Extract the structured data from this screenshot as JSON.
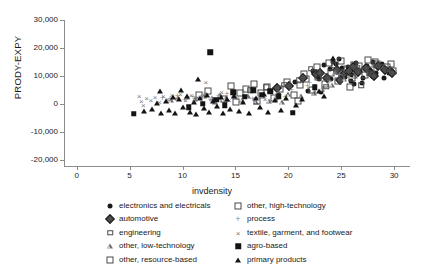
{
  "chart_data": {
    "type": "scatter",
    "title": "",
    "xlabel": "invdensity",
    "ylabel": "PRODY-EXPY",
    "xlim": [
      -1.2,
      31.5
    ],
    "ylim": [
      -22000,
      32000
    ],
    "xticks": [
      0,
      5,
      10,
      15,
      20,
      25,
      30
    ],
    "xticklabels": [
      "0",
      "5",
      "10",
      "15",
      "20",
      "25",
      "30"
    ],
    "yticks": [
      30000,
      20000,
      10000,
      0,
      -10000,
      -20000
    ],
    "yticklabels": [
      "30,000",
      "20,000",
      "10,000",
      "0",
      "-10,000",
      "-20,000"
    ],
    "grid": false,
    "legend_position": "below-axes",
    "series": [
      {
        "name": "electronics and electricals",
        "marker": "filled-circle",
        "color": "#1a1a1a",
        "points": [
          [
            22.3,
            11600
          ],
          [
            22.9,
            8800
          ],
          [
            23.4,
            13900
          ],
          [
            23.9,
            12400
          ],
          [
            24.2,
            15000
          ],
          [
            24.5,
            14100
          ],
          [
            24.8,
            16000
          ],
          [
            25.1,
            12800
          ],
          [
            25.4,
            9600
          ],
          [
            25.6,
            13200
          ],
          [
            26.0,
            10200
          ],
          [
            26.4,
            14500
          ],
          [
            26.8,
            11800
          ],
          [
            27.1,
            9100
          ],
          [
            27.4,
            13400
          ],
          [
            27.7,
            12100
          ],
          [
            28.0,
            14800
          ],
          [
            28.3,
            11200
          ],
          [
            28.6,
            13000
          ],
          [
            28.9,
            14200
          ],
          [
            29.2,
            12600
          ],
          [
            29.5,
            11000
          ],
          [
            21.9,
            4800
          ],
          [
            23.1,
            4200
          ],
          [
            24.0,
            9000
          ],
          [
            25.9,
            8200
          ],
          [
            27.0,
            7400
          ],
          [
            20.6,
            7900
          ],
          [
            26.2,
            7000
          ],
          [
            29.0,
            9400
          ]
        ]
      },
      {
        "name": "automotive",
        "marker": "filled-diamond",
        "color": "#4d4d4d",
        "points": [
          [
            22.6,
            10800
          ],
          [
            23.7,
            9400
          ],
          [
            24.6,
            12200
          ],
          [
            25.2,
            10400
          ],
          [
            26.1,
            13100
          ],
          [
            26.6,
            11400
          ],
          [
            27.3,
            12900
          ],
          [
            27.9,
            10600
          ],
          [
            28.5,
            13600
          ],
          [
            29.1,
            12000
          ],
          [
            29.6,
            11600
          ],
          [
            29.8,
            10900
          ],
          [
            21.4,
            9100
          ],
          [
            23.0,
            11000
          ],
          [
            24.9,
            8600
          ],
          [
            25.7,
            11900
          ],
          [
            28.1,
            9800
          ],
          [
            18.9,
            5600
          ],
          [
            20.1,
            6300
          ]
        ]
      },
      {
        "name": "engineering",
        "marker": "open-square-sm",
        "color": "#4a4a4a",
        "points": [
          [
            22.1,
            12500
          ],
          [
            23.3,
            10000
          ],
          [
            24.3,
            13800
          ],
          [
            25.0,
            11300
          ],
          [
            26.5,
            12700
          ],
          [
            27.6,
            11000
          ],
          [
            28.8,
            13300
          ],
          [
            29.4,
            12200
          ],
          [
            21.0,
            8400
          ],
          [
            19.6,
            6800
          ],
          [
            17.9,
            5900
          ],
          [
            16.4,
            4900
          ],
          [
            23.6,
            6200
          ],
          [
            26.9,
            6600
          ]
        ]
      },
      {
        "name": "other, low-technology",
        "marker": "open-triangle",
        "color": "#6e6e6e",
        "points": [
          [
            9.6,
            2100
          ],
          [
            10.4,
            2600
          ],
          [
            11.2,
            1800
          ],
          [
            12.0,
            2900
          ],
          [
            12.8,
            2300
          ],
          [
            13.5,
            3100
          ],
          [
            14.1,
            2000
          ],
          [
            14.9,
            3400
          ],
          [
            15.6,
            1500
          ],
          [
            16.2,
            2800
          ],
          [
            16.9,
            900
          ],
          [
            17.6,
            3000
          ],
          [
            18.2,
            1200
          ],
          [
            18.8,
            2400
          ],
          [
            19.4,
            600
          ],
          [
            20.0,
            3600
          ],
          [
            21.2,
            2700
          ],
          [
            22.4,
            4100
          ],
          [
            23.2,
            5400
          ],
          [
            24.1,
            6900
          ],
          [
            25.3,
            8800
          ],
          [
            26.3,
            10100
          ],
          [
            8.9,
            1400
          ],
          [
            13.1,
            800
          ],
          [
            19.0,
            4300
          ],
          [
            24.4,
            11400
          ]
        ]
      },
      {
        "name": "other, resource-based",
        "marker": "open-square",
        "color": "#4a4a4a",
        "points": [
          [
            14.6,
            6400
          ],
          [
            15.4,
            3900
          ],
          [
            16.0,
            5200
          ],
          [
            16.8,
            7100
          ],
          [
            17.4,
            4100
          ],
          [
            18.0,
            6000
          ],
          [
            18.6,
            2200
          ],
          [
            19.2,
            5500
          ],
          [
            19.9,
            7800
          ],
          [
            20.5,
            3300
          ],
          [
            21.1,
            6700
          ],
          [
            21.7,
            8900
          ],
          [
            22.2,
            5000
          ],
          [
            22.8,
            9600
          ],
          [
            23.5,
            7300
          ],
          [
            24.0,
            11000
          ],
          [
            24.7,
            8100
          ],
          [
            25.5,
            12300
          ],
          [
            26.0,
            9200
          ],
          [
            26.7,
            13500
          ],
          [
            27.2,
            10300
          ],
          [
            27.8,
            12000
          ],
          [
            28.4,
            14100
          ],
          [
            29.3,
            13000
          ],
          [
            29.9,
            11700
          ],
          [
            13.9,
            1700
          ],
          [
            15.1,
            900
          ],
          [
            17.0,
            1000
          ],
          [
            20.9,
            1100
          ],
          [
            12.4,
            4600
          ],
          [
            11.6,
            3200
          ],
          [
            25.8,
            6100
          ]
        ]
      },
      {
        "name": "other, high-technology",
        "marker": "open-square",
        "color": "#4a4a4a",
        "points": [
          [
            23.8,
            14600
          ],
          [
            25.0,
            15300
          ],
          [
            26.2,
            14000
          ],
          [
            28.2,
            15100
          ],
          [
            29.7,
            14400
          ],
          [
            22.7,
            13200
          ],
          [
            21.5,
            10600
          ],
          [
            27.5,
            15600
          ]
        ]
      },
      {
        "name": "process",
        "marker": "plus",
        "color": "#8f8f8f",
        "points": [
          [
            8.1,
            2200
          ],
          [
            8.8,
            1900
          ],
          [
            9.5,
            2700
          ],
          [
            10.2,
            1600
          ],
          [
            11.0,
            2400
          ],
          [
            11.8,
            3000
          ],
          [
            12.6,
            1300
          ],
          [
            13.4,
            2800
          ],
          [
            14.2,
            3500
          ],
          [
            15.0,
            2100
          ],
          [
            15.8,
            4000
          ],
          [
            16.6,
            1800
          ],
          [
            17.2,
            3700
          ],
          [
            18.4,
            4400
          ],
          [
            19.7,
            2500
          ],
          [
            20.3,
            4900
          ],
          [
            21.8,
            6500
          ],
          [
            23.9,
            8300
          ],
          [
            24.8,
            10500
          ],
          [
            22.0,
            7600
          ]
        ]
      },
      {
        "name": "textile, garment, and footwear",
        "marker": "cross",
        "color": "#7a7a7a",
        "points": [
          [
            6.1,
            1100
          ],
          [
            6.6,
            2000
          ],
          [
            7.0,
            1500
          ],
          [
            7.4,
            2600
          ],
          [
            7.8,
            900
          ],
          [
            8.2,
            2900
          ],
          [
            8.6,
            1800
          ],
          [
            9.0,
            3300
          ],
          [
            9.4,
            2200
          ],
          [
            9.8,
            3600
          ],
          [
            10.3,
            1400
          ],
          [
            10.8,
            3100
          ],
          [
            11.4,
            2500
          ],
          [
            12.1,
            3800
          ],
          [
            12.9,
            2000
          ],
          [
            13.7,
            4200
          ],
          [
            14.4,
            1600
          ],
          [
            12.2,
            7900
          ],
          [
            15.2,
            2300
          ],
          [
            16.1,
            3000
          ],
          [
            17.8,
            1900
          ],
          [
            5.9,
            3000
          ],
          [
            6.3,
            -200
          ]
        ]
      },
      {
        "name": "agro-based",
        "marker": "filled-square",
        "color": "#141414",
        "points": [
          [
            12.6,
            18500
          ],
          [
            5.4,
            -3400
          ],
          [
            20.4,
            -3000
          ],
          [
            14.8,
            4200
          ],
          [
            15.9,
            2600
          ],
          [
            16.7,
            5000
          ],
          [
            17.5,
            3400
          ],
          [
            13.2,
            1500
          ],
          [
            18.3,
            4600
          ],
          [
            19.1,
            2800
          ],
          [
            11.9,
            200
          ],
          [
            10.6,
            -1200
          ],
          [
            22.5,
            6000
          ],
          [
            14.0,
            -400
          ]
        ]
      },
      {
        "name": "primary products",
        "marker": "filled-triangle",
        "color": "#141414",
        "points": [
          [
            6.4,
            -2600
          ],
          [
            7.1,
            -1800
          ],
          [
            7.6,
            400
          ],
          [
            8.0,
            -3000
          ],
          [
            8.4,
            1000
          ],
          [
            8.7,
            -2200
          ],
          [
            9.1,
            2400
          ],
          [
            9.3,
            -3300
          ],
          [
            9.7,
            1700
          ],
          [
            10.0,
            -1000
          ],
          [
            10.4,
            2900
          ],
          [
            10.7,
            -2700
          ],
          [
            11.1,
            600
          ],
          [
            11.3,
            -3400
          ],
          [
            11.7,
            2000
          ],
          [
            12.0,
            -1500
          ],
          [
            12.3,
            3300
          ],
          [
            12.5,
            -2900
          ],
          [
            12.9,
            1200
          ],
          [
            13.3,
            -600
          ],
          [
            13.6,
            2600
          ],
          [
            13.8,
            -3100
          ],
          [
            14.2,
            1900
          ],
          [
            14.5,
            -1700
          ],
          [
            14.9,
            3000
          ],
          [
            15.3,
            -2300
          ],
          [
            15.7,
            900
          ],
          [
            16.3,
            -3200
          ],
          [
            16.9,
            2100
          ],
          [
            17.3,
            -1100
          ],
          [
            17.7,
            3500
          ],
          [
            18.1,
            -2800
          ],
          [
            18.7,
            1400
          ],
          [
            19.3,
            -2000
          ],
          [
            19.8,
            2300
          ],
          [
            11.5,
            9000
          ],
          [
            21.3,
            1700
          ],
          [
            22.9,
            4700
          ],
          [
            24.2,
            16400
          ],
          [
            20.7,
            -400
          ],
          [
            23.4,
            2900
          ],
          [
            9.9,
            5100
          ],
          [
            7.9,
            4700
          ]
        ]
      }
    ]
  },
  "legend": {
    "columns": [
      {
        "items": [
          {
            "label": "electronics and electricals",
            "marker": "filled-circle"
          },
          {
            "label": "automotive",
            "marker": "filled-diamond"
          },
          {
            "label": "engineering",
            "marker": "open-square-sm"
          },
          {
            "label": "other, low-technology",
            "marker": "open-triangle"
          },
          {
            "label": "other, resource-based",
            "marker": "open-square"
          }
        ]
      },
      {
        "items": [
          {
            "label": "other, high-technology",
            "marker": "open-square"
          },
          {
            "label": "process",
            "marker": "plus"
          },
          {
            "label": "textile, garment, and footwear",
            "marker": "cross"
          },
          {
            "label": "agro-based",
            "marker": "filled-square"
          },
          {
            "label": "primary products",
            "marker": "filled-triangle"
          }
        ]
      }
    ]
  }
}
